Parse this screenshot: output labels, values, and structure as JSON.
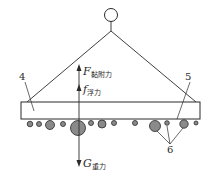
{
  "diagram": {
    "type": "force-diagram",
    "colors": {
      "line": "#2a2a2a",
      "bubble_fill": "#8a8a8a",
      "plate_fill": "#ffffff",
      "background": "#ffffff"
    },
    "forces": [
      {
        "id": "adhesion",
        "symbol": "F",
        "subscript": "黏附力",
        "direction": "up"
      },
      {
        "id": "buoyancy",
        "symbol": "f",
        "subscript": "浮力",
        "direction": "up"
      },
      {
        "id": "gravity",
        "symbol": "G",
        "subscript": "重力",
        "direction": "down"
      }
    ],
    "labels": {
      "plate": "4",
      "surface": "5",
      "bubbles": "6"
    },
    "parts": {
      "hook": "hook-ring",
      "rope": "sling-rope",
      "plate": "flat-plate",
      "bubbles": "bubble-row"
    }
  }
}
